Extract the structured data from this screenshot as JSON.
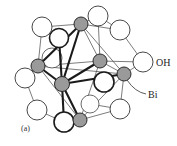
{
  "figure": {
    "panel_label": "(a)",
    "labels": {
      "oh": "OH",
      "bi": "Bi"
    },
    "colors": {
      "bi_fill": "#9a9a9a",
      "oh_fill": "#ffffff",
      "stroke": "#2a2a2a",
      "background": "#ffffff"
    },
    "bi_atoms": [
      {
        "id": "bi-top",
        "x": 81,
        "y": 24,
        "r": 7
      },
      {
        "id": "bi-left",
        "x": 38,
        "y": 66,
        "r": 7
      },
      {
        "id": "bi-center",
        "x": 62,
        "y": 84,
        "r": 7
      },
      {
        "id": "bi-right-mid",
        "x": 100,
        "y": 61,
        "r": 7
      },
      {
        "id": "bi-right",
        "x": 124,
        "y": 74,
        "r": 7
      },
      {
        "id": "bi-bottom",
        "x": 80,
        "y": 120,
        "r": 7
      }
    ],
    "oh_atoms": [
      {
        "id": "oh-1",
        "x": 42,
        "y": 27,
        "r": 10
      },
      {
        "id": "oh-2",
        "x": 98,
        "y": 16,
        "r": 10
      },
      {
        "id": "oh-3",
        "x": 120,
        "y": 30,
        "r": 10
      },
      {
        "id": "oh-4",
        "x": 59,
        "y": 38,
        "r": 10
      },
      {
        "id": "oh-5",
        "x": 52,
        "y": 58,
        "r": 10
      },
      {
        "id": "oh-6",
        "x": 143,
        "y": 62,
        "r": 10
      },
      {
        "id": "oh-7",
        "x": 25,
        "y": 78,
        "r": 10
      },
      {
        "id": "oh-8",
        "x": 104,
        "y": 82,
        "r": 10
      },
      {
        "id": "oh-9",
        "x": 90,
        "y": 104,
        "r": 9
      },
      {
        "id": "oh-10",
        "x": 37,
        "y": 110,
        "r": 10
      },
      {
        "id": "oh-11",
        "x": 120,
        "y": 109,
        "r": 10
      },
      {
        "id": "oh-12",
        "x": 64,
        "y": 122,
        "r": 10
      }
    ]
  }
}
